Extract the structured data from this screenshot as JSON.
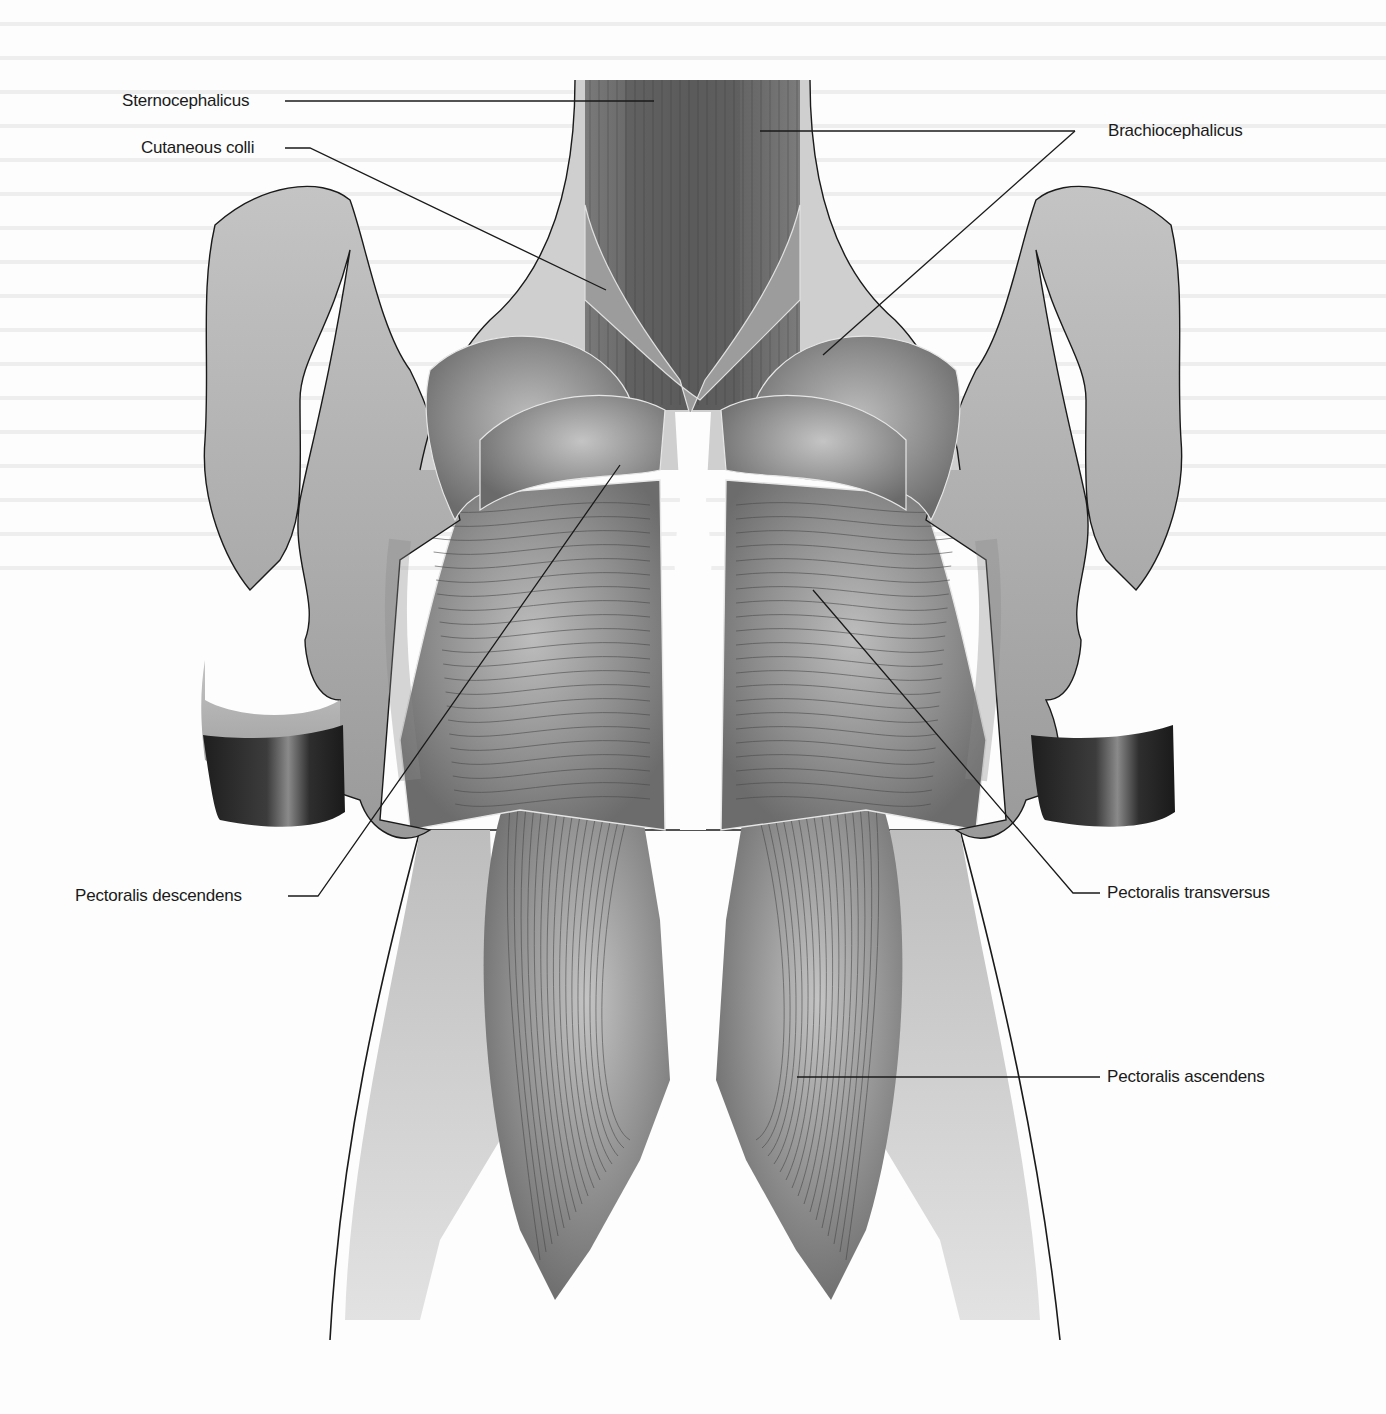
{
  "figure": {
    "labels": {
      "sternocephalicus": "Sternocephalicus",
      "cutaneous_colli": "Cutaneous colli",
      "brachiocephalicus": "Brachiocephalicus",
      "pectoralis_descendens": "Pectoralis descendens",
      "pectoralis_transversus": "Pectoralis transversus",
      "pectoralis_ascendens": "Pectoralis ascendens"
    },
    "colors": {
      "background": "#fdfdfd",
      "leader_line": "#1a1a1a",
      "muscle_dark": "#6e6e6e",
      "muscle_mid": "#8c8c8c",
      "muscle_light": "#b4b4b4",
      "skin": "#a8a8a8",
      "skin_light": "#d0d0d0",
      "hoof": "#2a2a2a",
      "fascia_edge": "#e6e6e6"
    }
  }
}
